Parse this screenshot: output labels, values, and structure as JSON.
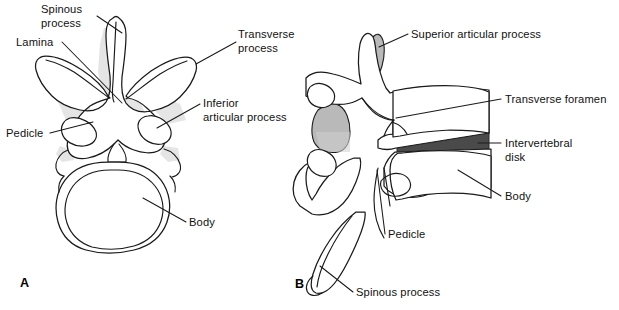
{
  "figure": {
    "background_color": "#ffffff",
    "line_color": "#1a1a1a",
    "shade_light_color": "#cfcfcf",
    "shade_mid_color": "#b9b9b9",
    "shade_dark_color": "#4a4a4a"
  },
  "panels": [
    {
      "letter": "A",
      "name": "superior-view",
      "labels": [
        {
          "key": "spinous_process",
          "text": "Spinous\nprocess"
        },
        {
          "key": "lamina",
          "text": "Lamina"
        },
        {
          "key": "pedicle",
          "text": "Pedicle"
        },
        {
          "key": "body",
          "text": "Body"
        },
        {
          "key": "inferior_articular_process",
          "text": "Inferior\narticular process"
        },
        {
          "key": "transverse_process",
          "text": "Transverse\nprocess"
        }
      ]
    },
    {
      "letter": "B",
      "name": "lateral-view",
      "labels": [
        {
          "key": "superior_articular_process",
          "text": "Superior articular process"
        },
        {
          "key": "transverse_foramen",
          "text": "Transverse foramen"
        },
        {
          "key": "intervertebral_disk",
          "text": "Intervertebral\ndisk"
        },
        {
          "key": "body",
          "text": "Body"
        },
        {
          "key": "pedicle",
          "text": "Pedicle"
        },
        {
          "key": "spinous_process",
          "text": "Spinous process"
        }
      ]
    }
  ],
  "labels": {
    "a_spinous_process": "Spinous\nprocess",
    "a_lamina": "Lamina",
    "a_pedicle": "Pedicle",
    "a_body": "Body",
    "a_inferior_articular_process": "Inferior\narticular process",
    "shared_transverse_process": "Transverse\nprocess",
    "b_superior_articular_process": "Superior articular process",
    "b_transverse_foramen": "Transverse foramen",
    "b_intervertebral_disk": "Intervertebral\ndisk",
    "b_body": "Body",
    "b_pedicle": "Pedicle",
    "b_spinous_process": "Spinous process",
    "panel_a_letter": "A",
    "panel_b_letter": "B"
  }
}
